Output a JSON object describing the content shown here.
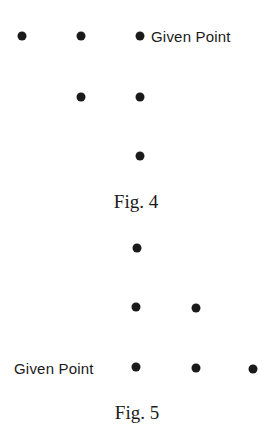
{
  "figures": [
    {
      "caption": "Fig. 4",
      "caption_pos": [
        136,
        202
      ],
      "given_point_label": "Given Point",
      "label_pos": [
        151,
        36
      ],
      "label_side": "right",
      "points": [
        {
          "x": 22,
          "y": 36
        },
        {
          "x": 81,
          "y": 36
        },
        {
          "x": 140,
          "y": 36,
          "given": true
        },
        {
          "x": 81,
          "y": 97
        },
        {
          "x": 140,
          "y": 97
        },
        {
          "x": 140,
          "y": 156
        }
      ]
    },
    {
      "caption": "Fig. 5",
      "caption_pos": [
        137,
        413
      ],
      "given_point_label": "Given Point",
      "label_pos": [
        14,
        368
      ],
      "label_side": "left",
      "points": [
        {
          "x": 137,
          "y": 248
        },
        {
          "x": 136,
          "y": 307
        },
        {
          "x": 196,
          "y": 308
        },
        {
          "x": 136,
          "y": 367,
          "given": true
        },
        {
          "x": 196,
          "y": 368
        },
        {
          "x": 253,
          "y": 369
        }
      ]
    }
  ]
}
